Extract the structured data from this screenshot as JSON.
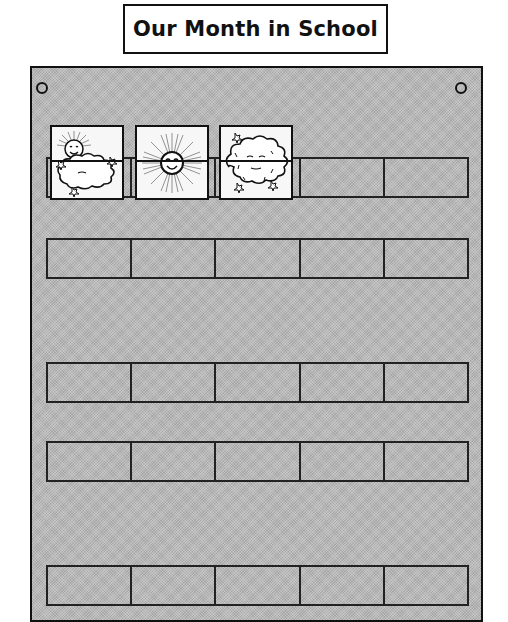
{
  "title": "Our Month in School",
  "board": {
    "color": "#b9b9b9",
    "grommets": [
      "top-left",
      "top-right"
    ],
    "rows": [
      {
        "pockets": 5,
        "cards": [
          {
            "weather": "partly-cloudy",
            "icon": "sun-behind-cloud-icon"
          },
          {
            "weather": "sunny",
            "icon": "sun-icon"
          },
          {
            "weather": "cloudy",
            "icon": "cloud-icon"
          },
          null,
          null
        ]
      },
      {
        "pockets": 5,
        "cards": [
          null,
          null,
          null,
          null,
          null
        ]
      },
      {
        "pockets": 5,
        "cards": [
          null,
          null,
          null,
          null,
          null
        ]
      },
      {
        "pockets": 5,
        "cards": [
          null,
          null,
          null,
          null,
          null
        ]
      },
      {
        "pockets": 5,
        "cards": [
          null,
          null,
          null,
          null,
          null
        ]
      }
    ]
  }
}
